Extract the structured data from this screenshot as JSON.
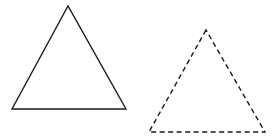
{
  "canvas": {
    "width": 273,
    "height": 139,
    "background": "#ffffff"
  },
  "shapes": [
    {
      "name": "solid-triangle",
      "style": "solid",
      "stroke": "#1a1a1a",
      "stroke_width": 1.4,
      "points": "68,6 12,109 126,109"
    },
    {
      "name": "dashed-triangle",
      "style": "dashed",
      "stroke": "#1a1a1a",
      "stroke_width": 1.4,
      "dash": "5,3.5",
      "points": "206,30 149,132 265,132"
    }
  ]
}
